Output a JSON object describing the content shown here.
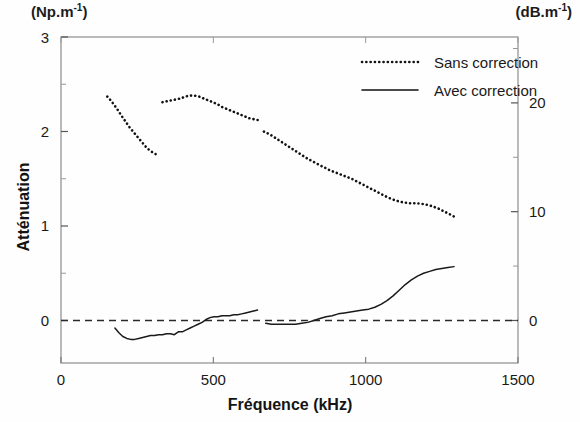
{
  "figure": {
    "unit_left": "(Np.m",
    "unit_left_exp": "-1",
    "unit_left_close": ")",
    "unit_right": "(dB.m",
    "unit_right_exp": "-1",
    "unit_right_close": ")",
    "ylabel": "Atténuation",
    "xlabel": "Fréquence (kHz)"
  },
  "chart_data": {
    "type": "line",
    "title": "",
    "xlabel": "Fréquence (kHz)",
    "ylabel": "Atténuation",
    "y_unit_left": "(Np.m-1)",
    "y_unit_right": "(dB.m-1)",
    "xlim": [
      0,
      1500
    ],
    "ylim": [
      -0.45,
      3
    ],
    "ylim_right": [
      -3.9,
      26.06
    ],
    "xticks": [
      0,
      500,
      1000,
      1500
    ],
    "yticks_left": [
      0,
      1,
      2,
      3
    ],
    "yticks_right": [
      0,
      10,
      20
    ],
    "yticks_left_minor": [
      0.5,
      1.5,
      2.5
    ],
    "yticks_right_minor": [
      5,
      15,
      25
    ],
    "grid": false,
    "legend_position": "top-right",
    "zero_reference_line": 0,
    "series": [
      {
        "name": "Sans correction",
        "style": "dotted",
        "color": "#111111",
        "segments": [
          {
            "x": [
              152,
              163,
              175,
              188,
              200,
              213,
              226,
              239,
              252,
              265,
              278,
              291,
              305,
              318
            ],
            "y": [
              2.37,
              2.33,
              2.28,
              2.22,
              2.16,
              2.1,
              2.04,
              1.99,
              1.94,
              1.89,
              1.84,
              1.8,
              1.77,
              1.75
            ]
          },
          {
            "x": [
              333,
              348,
              363,
              378,
              393,
              408,
              423,
              438,
              453,
              468,
              483,
              498,
              513,
              528,
              543,
              558,
              573,
              588,
              603,
              618,
              633,
              648
            ],
            "y": [
              2.31,
              2.32,
              2.33,
              2.34,
              2.35,
              2.37,
              2.38,
              2.38,
              2.37,
              2.35,
              2.33,
              2.31,
              2.29,
              2.26,
              2.24,
              2.22,
              2.2,
              2.18,
              2.16,
              2.14,
              2.13,
              2.12
            ]
          },
          {
            "x": [
              666,
              690,
              714,
              738,
              762,
              786,
              810,
              834,
              858,
              882,
              906,
              930,
              954,
              978,
              1002,
              1026,
              1050,
              1074,
              1098,
              1122,
              1146,
              1170,
              1194,
              1218,
              1242,
              1266,
              1290
            ],
            "y": [
              2.0,
              1.96,
              1.91,
              1.86,
              1.81,
              1.76,
              1.71,
              1.67,
              1.63,
              1.59,
              1.56,
              1.53,
              1.5,
              1.46,
              1.42,
              1.38,
              1.34,
              1.3,
              1.27,
              1.25,
              1.24,
              1.24,
              1.23,
              1.21,
              1.18,
              1.14,
              1.1
            ]
          }
        ]
      },
      {
        "name": "Avec correction",
        "style": "solid",
        "color": "#1a1a1a",
        "segments": [
          {
            "x": [
              177,
              190,
              203,
              216,
              229,
              242,
              255,
              268,
              281,
              294,
              307,
              320,
              333,
              346,
              359,
              372,
              385,
              398,
              411,
              424,
              437,
              450,
              463,
              476,
              489,
              502,
              515,
              528,
              541,
              554,
              567,
              580,
              593,
              606,
              619,
              632,
              645
            ],
            "y": [
              -0.08,
              -0.13,
              -0.17,
              -0.19,
              -0.2,
              -0.2,
              -0.19,
              -0.18,
              -0.17,
              -0.16,
              -0.16,
              -0.15,
              -0.15,
              -0.14,
              -0.14,
              -0.15,
              -0.12,
              -0.12,
              -0.1,
              -0.08,
              -0.06,
              -0.04,
              -0.02,
              0.01,
              0.03,
              0.04,
              0.04,
              0.05,
              0.05,
              0.05,
              0.06,
              0.06,
              0.07,
              0.08,
              0.09,
              0.1,
              0.11
            ]
          },
          {
            "x": [
              672,
              690,
              710,
              730,
              750,
              770,
              790,
              810,
              830,
              850,
              870,
              890,
              910,
              930,
              950,
              970,
              990,
              1010,
              1030,
              1050,
              1070,
              1090,
              1110,
              1130,
              1150,
              1170,
              1190,
              1210,
              1230,
              1250,
              1270,
              1290
            ],
            "y": [
              -0.03,
              -0.04,
              -0.04,
              -0.04,
              -0.04,
              -0.04,
              -0.03,
              -0.02,
              0.0,
              0.02,
              0.04,
              0.05,
              0.07,
              0.08,
              0.09,
              0.1,
              0.11,
              0.12,
              0.14,
              0.17,
              0.21,
              0.26,
              0.32,
              0.38,
              0.43,
              0.47,
              0.5,
              0.52,
              0.54,
              0.55,
              0.56,
              0.57
            ]
          }
        ]
      }
    ]
  },
  "legend": {
    "items": [
      {
        "label": "Sans correction",
        "style": "dotted"
      },
      {
        "label": "Avec correction",
        "style": "solid"
      }
    ]
  },
  "axes": {
    "x_tick_labels": [
      "0",
      "500",
      "1000",
      "1500"
    ],
    "y_left_tick_labels": [
      "0",
      "1",
      "2",
      "3"
    ],
    "y_right_tick_labels": [
      "0",
      "10",
      "20"
    ]
  }
}
